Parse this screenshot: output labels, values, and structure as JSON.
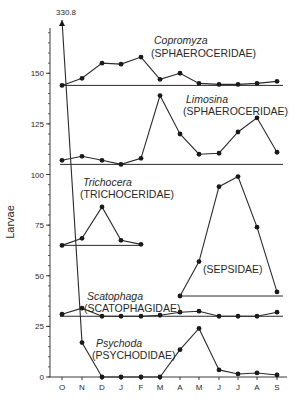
{
  "chart_data": {
    "type": "line",
    "title": "",
    "xlabel": "",
    "ylabel": "Larvae",
    "ylim": [
      0,
      170
    ],
    "yticks": [
      0,
      25,
      50,
      75,
      100,
      125,
      150
    ],
    "ytick_minor_step": 5,
    "grid": false,
    "legend": "inline labels",
    "categories": [
      "O",
      "N",
      "D",
      "J",
      "F",
      "M",
      "A",
      "M",
      "J",
      "J",
      "A",
      "S"
    ],
    "annotations": [
      {
        "text": "330.8",
        "note": "Psychoda value in October, off-scale (arrow)"
      }
    ],
    "series": [
      {
        "name": "Copromyza (SPHAEROCERIDAE)",
        "genus": "Copromyza",
        "family": "(SPHAEROCERIDAE)",
        "baseline": 144,
        "values": [
          144,
          147.5,
          155,
          154.5,
          158,
          147,
          150,
          145,
          144.5,
          144.5,
          145,
          146
        ]
      },
      {
        "name": "Limosina (SPHAEROCERIDAE)",
        "genus": "Limosina",
        "family": "(SPHAEROCERIDAE)",
        "baseline": 105,
        "values": [
          107,
          109,
          107,
          105,
          108,
          139,
          120,
          110,
          110.5,
          121,
          128,
          111
        ]
      },
      {
        "name": "Trichocera (TRICHOCERIDAE)",
        "genus": "Trichocera",
        "family": "(TRICHOCERIDAE)",
        "baseline": 65,
        "values": [
          65,
          68.5,
          84,
          67.5,
          65.5,
          null,
          null,
          null,
          null,
          null,
          null,
          null
        ]
      },
      {
        "name": "(SEPSIDAE)",
        "genus": "",
        "family": "(SEPSIDAE)",
        "baseline": 40,
        "values": [
          null,
          null,
          null,
          null,
          null,
          null,
          40,
          57,
          94,
          99,
          74,
          42
        ]
      },
      {
        "name": "Scatophaga (SCATOPHAGIDAE)",
        "genus": "Scatophaga",
        "family": "(SCATOPHAGIDAE)",
        "baseline": 30,
        "values": [
          31,
          34,
          30,
          30,
          30,
          30.5,
          32,
          32.5,
          30,
          30,
          30,
          32
        ]
      },
      {
        "name": "Psychoda (PSYCHODIDAE)",
        "genus": "Psychoda",
        "family": "(PSYCHODIDAE)",
        "baseline": 0,
        "values": [
          330.8,
          17,
          0,
          0,
          0,
          0,
          13.5,
          24,
          3.5,
          1.5,
          2,
          1
        ]
      }
    ]
  },
  "labels": {
    "ylabel": "Larvae",
    "off_scale_value": "330.8",
    "copromyza_genus": "Copromyza",
    "copromyza_family": "(SPHAEROCERIDAE)",
    "limosina_genus": "Limosina",
    "limosina_family": "(SPHAEROCERIDAE)",
    "trichocera_genus": "Trichocera",
    "trichocera_family": "(TRICHOCERIDAE)",
    "sepsidae_family": "(SEPSIDAE)",
    "scatophaga_genus": "Scatophaga",
    "scatophaga_family": "(SCATOPHAGIDAE)",
    "psychoda_genus": "Psychoda",
    "psychoda_family": "(PSYCHODIDAE)"
  },
  "colors": {
    "line": "#2b2b2b",
    "marker": "#1a1a1a",
    "axis": "#3a3a3a",
    "text": "#2a2a2a"
  }
}
